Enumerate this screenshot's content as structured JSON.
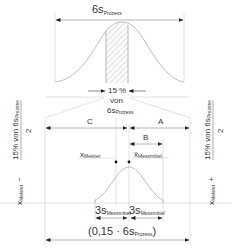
{
  "diagram": {
    "top": {
      "width_label_main": "6s",
      "width_label_sub": "Prozess",
      "percent_label": "15 %",
      "von_label": "von",
      "ref_main": "6s",
      "ref_sub": "Prozess"
    },
    "segments": {
      "c_label": "C",
      "a_label": "A",
      "b_label": "B"
    },
    "points": {
      "meister_main": "x",
      "meister_sub": "Meister",
      "messmittel_main": "x̄",
      "messmittel_sub": "Messmittel"
    },
    "bottom": {
      "three_s_main": "3s",
      "three_s_sub": "Messmittel",
      "total_prefix": "(0,15 · 6s",
      "total_sub": "Prozess",
      "total_suffix": ")"
    },
    "left_formula": {
      "x_main": "x",
      "x_sub": "Meister",
      "operator": "−",
      "numerator_main": "15% von 6s",
      "numerator_sub": "Prozess",
      "denominator": "2"
    },
    "right_formula": {
      "x_main": "x",
      "x_sub": "Meister",
      "operator": "+",
      "numerator_main": "15% von 6s",
      "numerator_sub": "Prozess",
      "denominator": "2"
    },
    "colors": {
      "lines": "#9a9a9a",
      "curves": "#b5b5b5",
      "text": "#333333"
    }
  }
}
